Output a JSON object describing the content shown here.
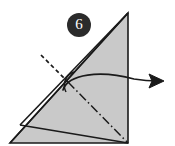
{
  "diagram": {
    "type": "paper-folding-instruction",
    "canvas": {
      "width": 175,
      "height": 146
    },
    "background_color": "#ffffff"
  },
  "step_badge": {
    "label": "6",
    "shape": "circle",
    "fill_color": "#2b2b2b",
    "text_color": "#ffffff",
    "center_x": 79,
    "center_y": 25,
    "radius": 12
  },
  "paper": {
    "name": "folded-triangle",
    "fill_color": "#c9c9c9",
    "stroke_color": "#1a1a1a",
    "stroke_width": 1.6,
    "outline_points": "128,13 128,143 10,143",
    "apex": {
      "x": 128,
      "y": 13
    },
    "bottom_right": {
      "x": 128,
      "y": 143
    },
    "bottom_left": {
      "x": 10,
      "y": 143
    }
  },
  "fold_lines": [
    {
      "name": "hypotenuse-edge",
      "style": "solid",
      "points": "128,13 10,143",
      "color": "#1a1a1a"
    },
    {
      "name": "long-valley-crease",
      "style": "solid",
      "points": "128,13 20,125",
      "color": "#1a1a1a"
    },
    {
      "name": "lower-flap-crease",
      "style": "solid",
      "points": "20,125 128,143",
      "color": "#1a1a1a"
    },
    {
      "name": "mountain-fold-axis",
      "style": "dash-dot",
      "points": "68,82 128,143",
      "color": "#1a1a1a",
      "dash_pattern": "9,3,1.5,3"
    },
    {
      "name": "reference-guide-line",
      "style": "dashed",
      "points": "41,55 70,84",
      "color": "#1a1a1a",
      "dash_pattern": "4,3"
    }
  ],
  "angle_marker": {
    "name": "fold-angle-arc",
    "color": "#1a1a1a",
    "path": "M 74,72 A 14,14 0 0 0 66,92"
  },
  "action_arrow": {
    "name": "unfold-direction-arrow",
    "color": "#1a1a1a",
    "curve_path": "M 63,90 C 68,74 100,70 134,79 C 146,81 152,81 158,81",
    "head_points": "164,81 149,74 152,81 149,88",
    "direction": "right",
    "meaning": "unfold / open outward"
  }
}
